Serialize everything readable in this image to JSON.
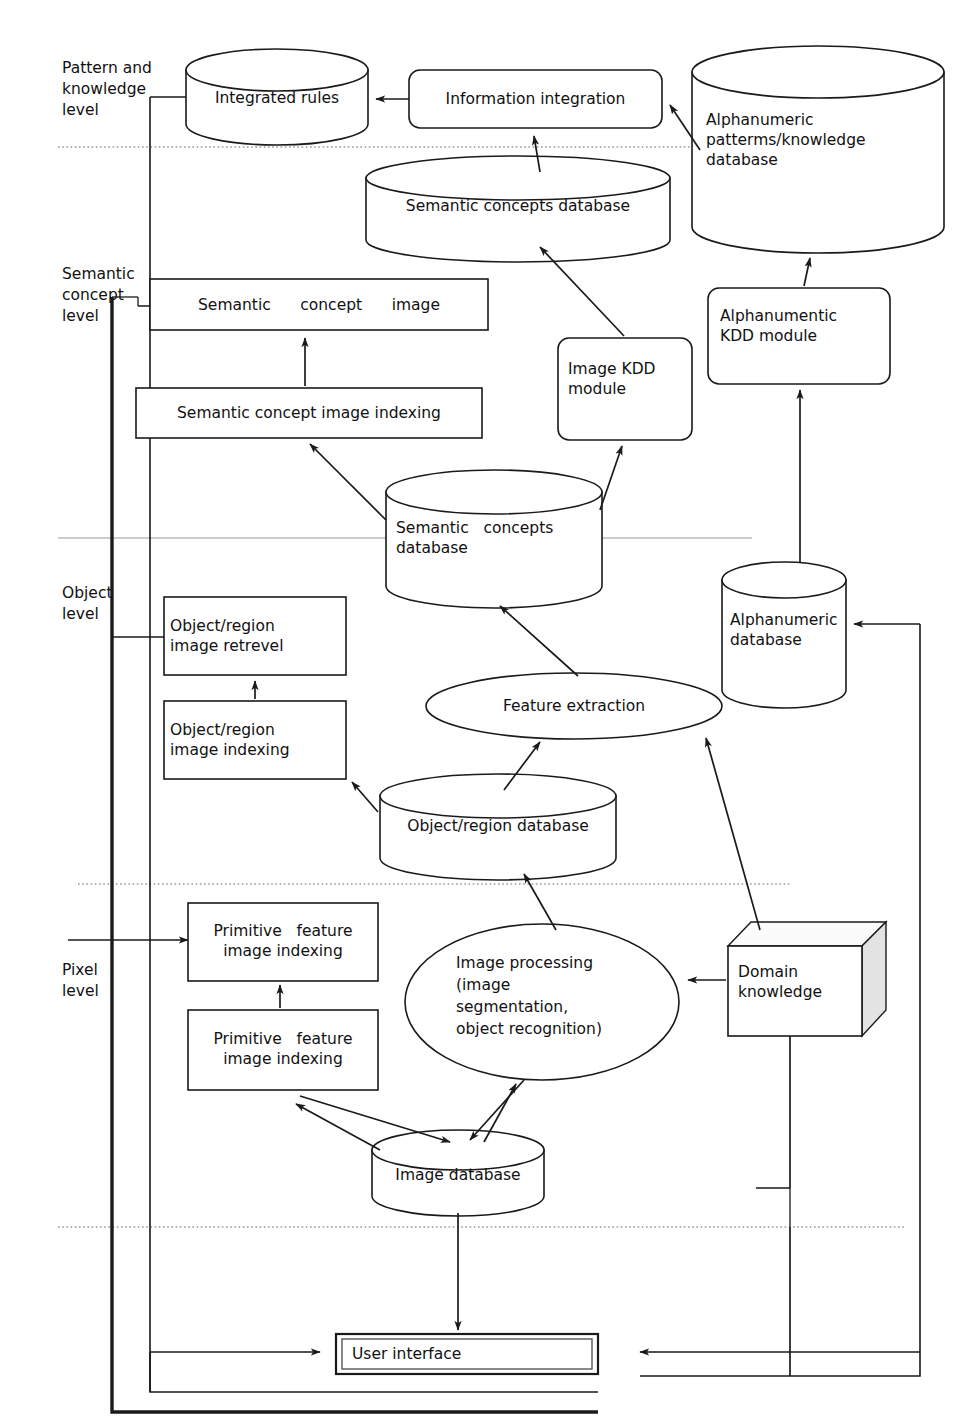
{
  "diagram": {
    "levels": [
      {
        "id": "pattern",
        "label": "Pattern and\nknowledge\nlevel"
      },
      {
        "id": "semantic",
        "label": "Semantic\nconcept\nlevel"
      },
      {
        "id": "object",
        "label": "Object\nlevel"
      },
      {
        "id": "pixel",
        "label": "Pixel\nlevel"
      }
    ],
    "nodes": [
      {
        "id": "integrated-rules",
        "label": "Integrated rules",
        "shape": "cylinder"
      },
      {
        "id": "information-integration",
        "label": "Information integration",
        "shape": "rounded-rect"
      },
      {
        "id": "alphanumeric-patterns-knowledge-database",
        "label": "Alphanumeric\npatterms/knowledge\ndatabase",
        "shape": "cylinder"
      },
      {
        "id": "semantic-concepts-database-top",
        "label": "Semantic concepts database",
        "shape": "cylinder"
      },
      {
        "id": "semantic-concept-image",
        "label": "Semantic      concept      image",
        "shape": "rect"
      },
      {
        "id": "semantic-concept-image-indexing",
        "label": "Semantic concept image indexing",
        "shape": "rect"
      },
      {
        "id": "image-kdd-module",
        "label": "Image KDD\nmodule",
        "shape": "rounded-rect"
      },
      {
        "id": "alphanumentic-kdd-module",
        "label": "Alphanumentic\nKDD module",
        "shape": "rounded-rect"
      },
      {
        "id": "semantic-concepts-database-mid",
        "label": "Semantic   concepts\ndatabase",
        "shape": "cylinder"
      },
      {
        "id": "object-region-image-retrevel",
        "label": "Object/region\nimage retrevel",
        "shape": "rect"
      },
      {
        "id": "object-region-image-indexing",
        "label": "Object/region\nimage indexing",
        "shape": "rect"
      },
      {
        "id": "feature-extraction",
        "label": "Feature extraction",
        "shape": "ellipse"
      },
      {
        "id": "alphanumeric-database",
        "label": "Alphanumeric\ndatabase",
        "shape": "cylinder"
      },
      {
        "id": "object-region-database",
        "label": "Object/region database",
        "shape": "cylinder"
      },
      {
        "id": "primitive-feature-image-indexing-upper",
        "label": "Primitive   feature\nimage indexing",
        "shape": "rect"
      },
      {
        "id": "primitive-feature-image-indexing-lower",
        "label": "Primitive   feature\nimage indexing",
        "shape": "rect"
      },
      {
        "id": "image-processing",
        "label": "Image processing\n(image\nsegmentation,\nobject recognition)",
        "shape": "ellipse"
      },
      {
        "id": "domain-knowledge",
        "label": "Domain\nknowledge",
        "shape": "box3d"
      },
      {
        "id": "image-database",
        "label": "Image database",
        "shape": "cylinder"
      },
      {
        "id": "user-interface",
        "label": "User interface",
        "shape": "double-rect"
      }
    ],
    "colors": {
      "stroke": "#1a1a1a",
      "fill": "#ffffff",
      "divider": "#999999",
      "box3d_side": "#e3e3e3"
    }
  }
}
